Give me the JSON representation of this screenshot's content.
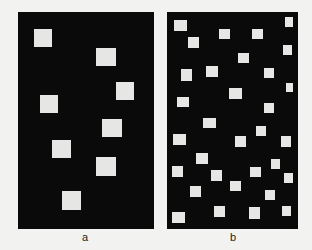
{
  "figure": {
    "background": "#f2f2f0",
    "square_color": "#e6e6e4",
    "panel_color": "#0a0a0a",
    "panels": [
      {
        "id": "a",
        "label": "a",
        "rect": [
          18,
          12,
          136,
          217
        ],
        "label_pos": [
          85,
          232
        ],
        "squares": [
          [
            34,
            29,
            18,
            18
          ],
          [
            96,
            48,
            20,
            18
          ],
          [
            116,
            82,
            18,
            18
          ],
          [
            40,
            95,
            18,
            18
          ],
          [
            102,
            119,
            20,
            18
          ],
          [
            52,
            140,
            19,
            18
          ],
          [
            96,
            157,
            20,
            19
          ],
          [
            62,
            191,
            19,
            19
          ]
        ]
      },
      {
        "id": "b",
        "label": "b",
        "rect": [
          167,
          12,
          131,
          217
        ],
        "label_pos": [
          233,
          232
        ],
        "squares": [
          [
            174,
            20,
            13,
            11
          ],
          [
            285,
            17,
            8,
            10
          ],
          [
            219,
            29,
            11,
            10
          ],
          [
            252,
            29,
            11,
            10
          ],
          [
            188,
            37,
            11,
            11
          ],
          [
            283,
            45,
            9,
            10
          ],
          [
            238,
            53,
            11,
            10
          ],
          [
            181,
            69,
            11,
            12
          ],
          [
            206,
            66,
            12,
            11
          ],
          [
            264,
            68,
            10,
            10
          ],
          [
            286,
            83,
            7,
            9
          ],
          [
            229,
            88,
            13,
            11
          ],
          [
            177,
            97,
            12,
            10
          ],
          [
            264,
            103,
            10,
            10
          ],
          [
            203,
            118,
            13,
            10
          ],
          [
            256,
            126,
            10,
            10
          ],
          [
            173,
            134,
            13,
            11
          ],
          [
            235,
            136,
            11,
            11
          ],
          [
            281,
            136,
            10,
            11
          ],
          [
            196,
            153,
            12,
            11
          ],
          [
            271,
            159,
            9,
            10
          ],
          [
            172,
            166,
            11,
            11
          ],
          [
            211,
            170,
            11,
            11
          ],
          [
            250,
            167,
            11,
            10
          ],
          [
            284,
            173,
            9,
            10
          ],
          [
            230,
            181,
            11,
            10
          ],
          [
            190,
            186,
            11,
            11
          ],
          [
            265,
            190,
            10,
            10
          ],
          [
            172,
            212,
            13,
            11
          ],
          [
            214,
            206,
            11,
            11
          ],
          [
            249,
            207,
            11,
            12
          ],
          [
            282,
            206,
            9,
            10
          ]
        ]
      }
    ]
  }
}
